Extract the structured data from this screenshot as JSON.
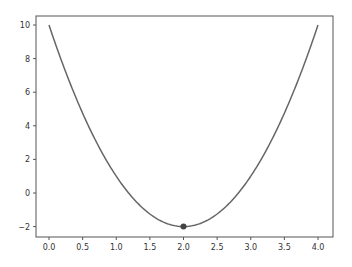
{
  "chart_data": {
    "type": "line",
    "title": "",
    "xlabel": "",
    "ylabel": "",
    "xlim": [
      -0.2,
      4.2
    ],
    "ylim": [
      -2.6,
      10.6
    ],
    "grid": false,
    "legend": null,
    "x_ticks": [
      0.0,
      0.5,
      1.0,
      1.5,
      2.0,
      2.5,
      3.0,
      3.5,
      4.0
    ],
    "x_tick_labels": [
      "0.0",
      "0.5",
      "1.0",
      "1.5",
      "2.0",
      "2.5",
      "3.0",
      "3.5",
      "4.0"
    ],
    "y_ticks": [
      -2,
      0,
      2,
      4,
      6,
      8,
      10
    ],
    "y_tick_labels": [
      "−2",
      "0",
      "2",
      "4",
      "6",
      "8",
      "10"
    ],
    "series": [
      {
        "name": "f(x) = 3(x-2)^2 - 2",
        "type": "line",
        "color": "#666666",
        "x": [
          0.0,
          0.25,
          0.5,
          0.75,
          1.0,
          1.25,
          1.5,
          1.75,
          2.0,
          2.25,
          2.5,
          2.75,
          3.0,
          3.25,
          3.5,
          3.75,
          4.0
        ],
        "y": [
          10.0,
          7.1875,
          4.75,
          2.6875,
          1.0,
          -0.3125,
          -1.25,
          -1.8125,
          -2.0,
          -1.8125,
          -1.25,
          -0.3125,
          1.0,
          2.6875,
          4.75,
          7.1875,
          10.0
        ]
      },
      {
        "name": "minimum",
        "type": "scatter",
        "color": "#444444",
        "x": [
          2.0
        ],
        "y": [
          -2.0
        ]
      }
    ]
  }
}
